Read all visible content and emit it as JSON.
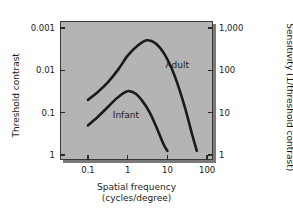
{
  "chart_data": {
    "type": "line",
    "title": "",
    "xlabel": "Spatial frequency (cycles/degree)",
    "xlabel_line1": "Spatial frequency",
    "xlabel_line2": "(cycles/degree)",
    "ylabel": "Threshold contrast",
    "ylabel_right": "Sensitivity (1/threshold contrast)",
    "xscale": "log",
    "yscale": "log",
    "y_inverted": true,
    "xlim": [
      0.0631,
      158.5
    ],
    "ylim": [
      0.0006,
      1.58
    ],
    "grid": false,
    "legend": "inline-annotation",
    "xticks": [
      0.1,
      1,
      10,
      100
    ],
    "xticklabels": [
      "0.1",
      "1",
      "10",
      "100"
    ],
    "yticks": [
      0.001,
      0.01,
      0.1,
      1
    ],
    "yticklabels": [
      "0.001",
      "0.01",
      "0.1",
      "1"
    ],
    "yticklabels_right": [
      "1,000",
      "100",
      "10",
      "1"
    ],
    "series": [
      {
        "name": "Adult",
        "label": "Adult",
        "color": "#1a1a1a",
        "x": [
          0.1,
          0.18,
          0.32,
          0.58,
          1.0,
          1.8,
          3.0,
          5.0,
          8.5,
          15.0,
          27.0,
          42.0,
          55.0
        ],
        "contrast": [
          0.05,
          0.032,
          0.019,
          0.0095,
          0.0045,
          0.0026,
          0.00195,
          0.0023,
          0.0042,
          0.013,
          0.07,
          0.33,
          0.8
        ],
        "sensitivity": [
          20,
          31,
          53,
          105,
          222,
          385,
          513,
          435,
          238,
          77,
          14,
          3.0,
          1.25
        ]
      },
      {
        "name": "Infant",
        "label": "Infant",
        "color": "#1a1a1a",
        "x": [
          0.1,
          0.17,
          0.3,
          0.5,
          0.8,
          1.1,
          1.6,
          2.4,
          3.6,
          5.5,
          8.0,
          10.0
        ],
        "contrast": [
          0.2,
          0.13,
          0.078,
          0.048,
          0.034,
          0.031,
          0.036,
          0.055,
          0.1,
          0.24,
          0.56,
          0.8
        ],
        "sensitivity": [
          5,
          7.7,
          12.8,
          20.8,
          29.4,
          32.3,
          27.8,
          18.2,
          10,
          4.2,
          1.8,
          1.25
        ]
      }
    ],
    "annotations": [
      {
        "text": "Adult",
        "x": 9.0,
        "y_contrast": 0.0075
      },
      {
        "text": "Infant",
        "x": 0.42,
        "y_contrast": 0.115
      }
    ]
  },
  "axes": {
    "left_title": "Threshold contrast",
    "right_title": "Sensitivity (1/threshold contrast)",
    "x_title_line1": "Spatial frequency",
    "x_title_line2": "(cycles/degree)"
  }
}
